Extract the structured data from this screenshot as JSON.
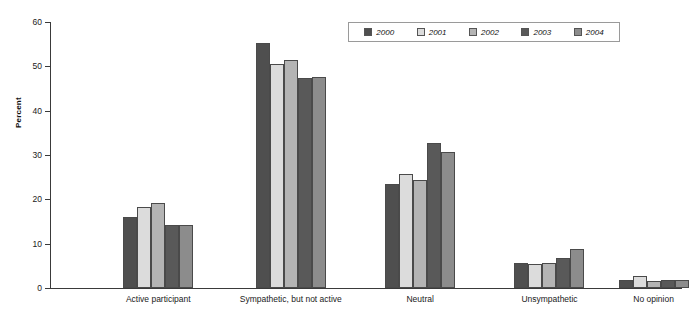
{
  "chart_data": {
    "type": "bar",
    "title": "",
    "subtitle": "",
    "xlabel": "",
    "ylabel": "Percent",
    "ylim": [
      0,
      60
    ],
    "yticks": [
      0,
      10,
      20,
      30,
      40,
      50,
      60
    ],
    "grid": false,
    "legend_position": "top-right",
    "categories": [
      "Active participant",
      "Sympathetic, but not active",
      "Neutral",
      "Unsympathetic",
      "No opinion"
    ],
    "series": [
      {
        "name": "2000",
        "color": "#4f4f4f",
        "values": [
          16.0,
          55.3,
          23.5,
          5.6,
          1.8
        ]
      },
      {
        "name": "2001",
        "color": "#dcdcdc",
        "values": [
          18.3,
          50.5,
          25.7,
          5.5,
          2.8
        ]
      },
      {
        "name": "2002",
        "color": "#b4b4b4",
        "values": [
          19.2,
          51.4,
          24.4,
          5.6,
          1.5
        ]
      },
      {
        "name": "2003",
        "color": "#595959",
        "values": [
          14.2,
          47.4,
          32.8,
          6.7,
          1.8
        ]
      },
      {
        "name": "2004",
        "color": "#8c8c8c",
        "values": [
          14.2,
          47.5,
          30.7,
          8.9,
          1.8
        ]
      }
    ]
  },
  "legend": {
    "entries": [
      {
        "label": "2000"
      },
      {
        "label": "2001"
      },
      {
        "label": "2002"
      },
      {
        "label": "2003"
      },
      {
        "label": "2004"
      }
    ]
  },
  "axis": {
    "y_title": "Percent",
    "y_tick_labels": [
      "60",
      "50",
      "40",
      "30",
      "20",
      "10",
      "0"
    ]
  }
}
